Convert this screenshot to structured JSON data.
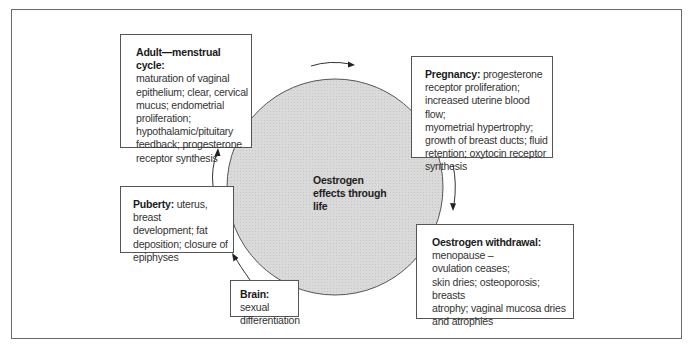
{
  "diagram": {
    "center": {
      "label_lines": [
        "Oestrogen",
        "effects through",
        "life"
      ]
    },
    "colors": {
      "circle_fill": "#d9d9d9",
      "circle_stroke": "#555555",
      "box_border": "#555555",
      "frame_border": "#6a6a6a"
    },
    "stages": [
      {
        "id": "adult",
        "heading": "Adult—menstrual cycle:",
        "body_lines": [
          "maturation of vaginal",
          "epithelium; clear, cervical",
          "mucus; endometrial",
          "proliferation;",
          "hypothalamic/pituitary",
          "feedback; progesterone",
          "receptor synthesis"
        ]
      },
      {
        "id": "pregnancy",
        "heading": "Pregnancy:",
        "first_line_rest": " progesterone",
        "body_lines": [
          "receptor proliferation;",
          "increased uterine blood flow;",
          "myometrial hypertrophy;",
          "growth of breast ducts; fluid",
          "retention; oxytocin receptor",
          "synthesis"
        ]
      },
      {
        "id": "withdrawal",
        "heading": "Oestrogen withdrawal:",
        "body_lines": [
          "menopause –",
          "ovulation ceases;",
          "skin dries; osteoporosis; breasts",
          "atrophy; vaginal mucosa dries",
          "and atrophies"
        ]
      },
      {
        "id": "puberty",
        "heading": "Puberty:",
        "first_line_rest": " uterus, breast",
        "body_lines": [
          "development; fat",
          "deposition; closure of",
          "epiphyses"
        ]
      },
      {
        "id": "brain",
        "heading": "Brain:",
        "first_line_rest": " sexual",
        "body_lines": [
          "differentiation"
        ]
      }
    ],
    "flow": [
      "brain",
      "puberty",
      "adult",
      "pregnancy",
      "withdrawal"
    ]
  }
}
